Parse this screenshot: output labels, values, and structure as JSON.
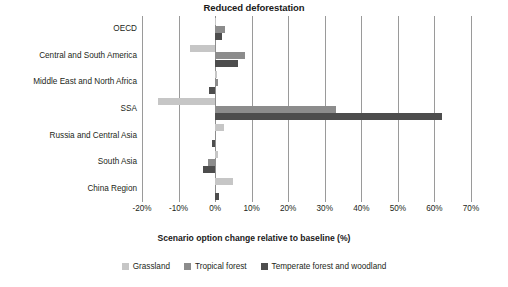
{
  "chart_data": {
    "type": "bar",
    "orientation": "horizontal",
    "title": "Reduced deforestation",
    "xlabel": "Scenario option change relative to baseline (%)",
    "ylabel": "",
    "xlim": [
      -20,
      70
    ],
    "xticks": [
      "-20%",
      "-10%",
      "0%",
      "10%",
      "20%",
      "30%",
      "40%",
      "50%",
      "60%",
      "70%"
    ],
    "xtick_values": [
      -20,
      -10,
      0,
      10,
      20,
      30,
      40,
      50,
      60,
      70
    ],
    "grid": true,
    "legend_position": "bottom",
    "categories": [
      "OECD",
      "Central and South America",
      "Middle East and North Africa",
      "SSA",
      "Russia and Central Asia",
      "South Asia",
      "China Region"
    ],
    "series": [
      {
        "name": "Grassland",
        "color": "#c6c6c6",
        "values": [
          0.3,
          -7.0,
          0.6,
          -15.5,
          2.3,
          0.7,
          5.0
        ]
      },
      {
        "name": "Tropical forest",
        "color": "#8c8c8c",
        "values": [
          2.6,
          8.3,
          0.9,
          33.0,
          0.2,
          -1.9,
          0.3
        ]
      },
      {
        "name": "Temperate forest and woodland",
        "color": "#4d4d4d",
        "values": [
          2.0,
          6.2,
          -1.6,
          62.0,
          -0.8,
          -3.2,
          1.1
        ]
      }
    ]
  }
}
